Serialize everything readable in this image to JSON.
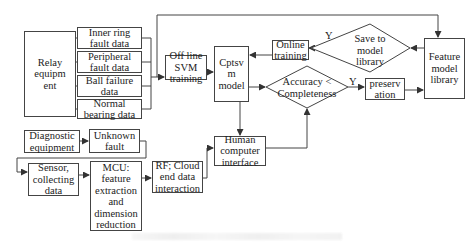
{
  "diagram": {
    "nodes": {
      "relay_equipment": "Relay equipm ent",
      "inner_ring": "Inner ring fault data",
      "peripheral": "Peripheral fault data",
      "ball_failure": "Ball failure data",
      "normal_bearing": "Normal bearing data",
      "offline_svm": "Off line SVM training",
      "cptsvm_model": "Cptsv m model",
      "online_training": "Online training",
      "save_to_library": "Save to model library",
      "feature_library": "Feature model library",
      "accuracy_check": "Accuracy < Completeness",
      "preservation": "preserv ation",
      "diagnostic_equipment": "Diagnostic equipment",
      "unknown_fault": "Unknown fault",
      "sensor": "Sensor, collecting data",
      "mcu": "MCU: feature extraction and dimension reduction",
      "rf_cloud": "RF; Cloud end data interaction",
      "hci": "Human computer interface"
    },
    "edge_labels": {
      "save_yes": "Y",
      "accuracy_yes": "Y"
    },
    "line_color": "#444444",
    "caption": ""
  }
}
